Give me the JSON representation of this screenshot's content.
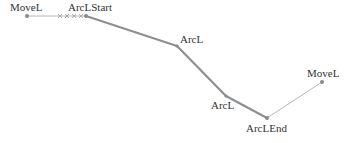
{
  "diagram": {
    "colors": {
      "thin_line": "#b8b8b8",
      "thick_line": "#8f8f8f",
      "point": "#8a8a8a",
      "label": "#333333"
    },
    "points": [
      {
        "label": "MoveL",
        "x": 27,
        "y": 16,
        "lx": 10,
        "ly": 11
      },
      {
        "label": "ArcLStart",
        "x": 86,
        "y": 16,
        "lx": 68,
        "ly": 11
      },
      {
        "label": "ArcL",
        "x": 177,
        "y": 46,
        "lx": 180,
        "ly": 43
      },
      {
        "label": "ArcL",
        "x": 226,
        "y": 96,
        "lx": 211,
        "ly": 109
      },
      {
        "label": "ArcLEnd",
        "x": 267,
        "y": 118,
        "lx": 246,
        "ly": 132
      },
      {
        "label": "MoveL",
        "x": 322,
        "y": 82,
        "lx": 307,
        "ly": 77
      }
    ]
  }
}
